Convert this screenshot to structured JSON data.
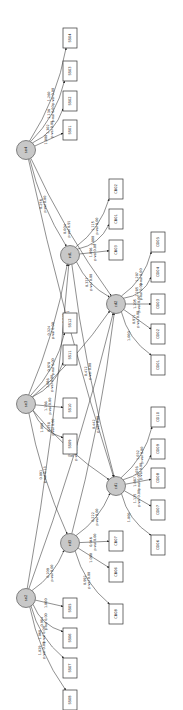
{
  "diagram": {
    "type": "structural-equation-path-diagram",
    "orientation": "rotated-90-ccw",
    "latent": [
      {
        "id": "se4",
        "label": "se4",
        "x": 26,
        "y": 150
      },
      {
        "id": "se3",
        "label": "se3",
        "x": 26,
        "y": 404
      },
      {
        "id": "se2",
        "label": "se2",
        "x": 26,
        "y": 598
      },
      {
        "id": "rd1",
        "label": "rd1",
        "x": 70,
        "y": 255
      },
      {
        "id": "rd3",
        "label": "rd3",
        "x": 70,
        "y": 543
      },
      {
        "id": "cd2",
        "label": "cd2",
        "x": 116,
        "y": 304
      },
      {
        "id": "cd1",
        "label": "cd1",
        "x": 116,
        "y": 486
      }
    ],
    "observed": [
      {
        "id": "SS04",
        "label": "SS04",
        "x": 70,
        "y": 38
      },
      {
        "id": "SS03",
        "label": "SS03",
        "x": 70,
        "y": 71
      },
      {
        "id": "SS02",
        "label": "SS02",
        "x": 70,
        "y": 101
      },
      {
        "id": "SS01",
        "label": "SS01",
        "x": 70,
        "y": 130
      },
      {
        "id": "CB02",
        "label": "CB02",
        "x": 116,
        "y": 189
      },
      {
        "id": "CB01",
        "label": "CB01",
        "x": 116,
        "y": 219
      },
      {
        "id": "CB03",
        "label": "CB03",
        "x": 116,
        "y": 250
      },
      {
        "id": "SS12",
        "label": "SS12",
        "x": 70,
        "y": 323
      },
      {
        "id": "SS11",
        "label": "SS11",
        "x": 70,
        "y": 355
      },
      {
        "id": "SS10",
        "label": "SS10",
        "x": 70,
        "y": 408
      },
      {
        "id": "SS09",
        "label": "SS09",
        "x": 70,
        "y": 444
      },
      {
        "id": "CD05",
        "label": "CD05",
        "x": 158,
        "y": 242
      },
      {
        "id": "CD04",
        "label": "CD04",
        "x": 158,
        "y": 272
      },
      {
        "id": "CD03",
        "label": "CD03",
        "x": 158,
        "y": 304
      },
      {
        "id": "CD02",
        "label": "CD02",
        "x": 158,
        "y": 334
      },
      {
        "id": "CD01",
        "label": "CD01",
        "x": 158,
        "y": 365
      },
      {
        "id": "CD10",
        "label": "CD10",
        "x": 158,
        "y": 417
      },
      {
        "id": "CD09",
        "label": "CD09",
        "x": 158,
        "y": 449
      },
      {
        "id": "CD08",
        "label": "CD08",
        "x": 158,
        "y": 478
      },
      {
        "id": "CD07",
        "label": "CD07",
        "x": 158,
        "y": 510
      },
      {
        "id": "CD06",
        "label": "CD06",
        "x": 158,
        "y": 545
      },
      {
        "id": "CB07",
        "label": "CB07",
        "x": 116,
        "y": 541
      },
      {
        "id": "CB06",
        "label": "CB06",
        "x": 116,
        "y": 572
      },
      {
        "id": "CB08",
        "label": "CB08",
        "x": 116,
        "y": 614
      },
      {
        "id": "SS05",
        "label": "SS05",
        "x": 70,
        "y": 608
      },
      {
        "id": "SS06",
        "label": "SS06",
        "x": 70,
        "y": 638
      },
      {
        "id": "SS07",
        "label": "SS07",
        "x": 70,
        "y": 668
      },
      {
        "id": "SS08",
        "label": "SS08",
        "x": 70,
        "y": 700
      }
    ],
    "edges": [
      {
        "from": "se4",
        "to": "SS04",
        "coef": "1.260",
        "p": "p-val 0.00"
      },
      {
        "from": "se4",
        "to": "SS03",
        "coef": "1.136",
        "p": "p-val 0.00"
      },
      {
        "from": "se4",
        "to": "SS02",
        "coef": "1.302",
        "p": "p-val 0.00"
      },
      {
        "from": "se4",
        "to": "SS01",
        "coef": "1.000",
        "p": ""
      },
      {
        "from": "se4",
        "to": "cd2",
        "coef": "0.004",
        "p": "p-val 0.91"
      },
      {
        "from": "se4",
        "to": "cd1",
        "coef": "-0.049",
        "p": "p-val 0.21"
      },
      {
        "from": "se4",
        "to": "rd1",
        "coef": "0.256",
        "p": "p-val 0.00"
      },
      {
        "from": "rd1",
        "to": "CB02",
        "coef": "1.115",
        "p": "p-val 0.00"
      },
      {
        "from": "rd1",
        "to": "CB01",
        "coef": "1.000",
        "p": ""
      },
      {
        "from": "rd1",
        "to": "CB03",
        "coef": "1.096",
        "p": "p-val 0.00"
      },
      {
        "from": "rd1",
        "to": "cd2",
        "coef": "0.377",
        "p": "p-val 0.00"
      },
      {
        "from": "rd1",
        "to": "cd1",
        "coef": "0.412",
        "p": "p-val 0.00"
      },
      {
        "from": "cd2",
        "to": "CD05",
        "coef": "1.207",
        "p": "p-val 0.00"
      },
      {
        "from": "cd2",
        "to": "CD04",
        "coef": "1.285",
        "p": "p-val 0.00"
      },
      {
        "from": "cd2",
        "to": "CD03",
        "coef": "1.205",
        "p": "p-val 0.00"
      },
      {
        "from": "cd2",
        "to": "CD02",
        "coef": "0.911",
        "p": "p-val 0.00"
      },
      {
        "from": "cd2",
        "to": "CD01",
        "coef": "1.000",
        "p": ""
      },
      {
        "from": "se3",
        "to": "rd1",
        "coef": "0.324",
        "p": "p-val 0.00"
      },
      {
        "from": "se3",
        "to": "cd2",
        "coef": "0.097",
        "p": "p-val 0.12"
      },
      {
        "from": "se3",
        "to": "SS12",
        "coef": "0.978",
        "p": "p-val 0.00"
      },
      {
        "from": "se3",
        "to": "SS11",
        "coef": "1.086",
        "p": "p-val 0.00"
      },
      {
        "from": "se3",
        "to": "SS10",
        "coef": "1.166",
        "p": "p-val 0.00"
      },
      {
        "from": "se3",
        "to": "SS09",
        "coef": "1.000",
        "p": ""
      },
      {
        "from": "se3",
        "to": "cd1",
        "coef": "0.929",
        "p": "p-val 0.00"
      },
      {
        "from": "se3",
        "to": "rd3",
        "coef": "0.091",
        "p": "p-val 0.13"
      },
      {
        "from": "cd1",
        "to": "CD10",
        "coef": "1.032",
        "p": "p-val 0.00"
      },
      {
        "from": "cd1",
        "to": "CD09",
        "coef": "1.076",
        "p": "p-val 0.00"
      },
      {
        "from": "cd1",
        "to": "CD08",
        "coef": "1.087",
        "p": "p-val 0.00"
      },
      {
        "from": "cd1",
        "to": "CD07",
        "coef": "1.115",
        "p": "p-val 0.00"
      },
      {
        "from": "cd1",
        "to": "CD06",
        "coef": "1.000",
        "p": ""
      },
      {
        "from": "rd3",
        "to": "cd2",
        "coef": "0.442",
        "p": "p-val 0.00"
      },
      {
        "from": "rd3",
        "to": "cd1",
        "coef": "0.222",
        "p": "p-val 0.00"
      },
      {
        "from": "rd3",
        "to": "CB07",
        "coef": "0.946",
        "p": "p-val 0.00"
      },
      {
        "from": "rd3",
        "to": "CB06",
        "coef": "1.000",
        "p": ""
      },
      {
        "from": "rd3",
        "to": "CB08",
        "coef": "0.992",
        "p": "p-val 0.00"
      },
      {
        "from": "se2",
        "to": "rd3",
        "coef": "0.209",
        "p": "p-val 0.00"
      },
      {
        "from": "se2",
        "to": "rd1",
        "coef": "0.258",
        "p": "p-val 0.00"
      },
      {
        "from": "se2",
        "to": "cd2",
        "coef": "0.706",
        "p": "p-val 0.28"
      },
      {
        "from": "se2",
        "to": "SS05",
        "coef": "1.000",
        "p": ""
      },
      {
        "from": "se2",
        "to": "SS06",
        "coef": "0.984",
        "p": "p-val 0.00"
      },
      {
        "from": "se2",
        "to": "SS07",
        "coef": "1.068",
        "p": "p-val 0.00"
      },
      {
        "from": "se2",
        "to": "SS08",
        "coef": "1.029",
        "p": "p-val 0.00"
      }
    ]
  }
}
